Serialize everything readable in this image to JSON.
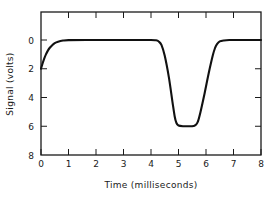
{
  "chart_data": {
    "type": "line",
    "title": "",
    "xlabel": "Time  (milliseconds)",
    "ylabel": "Signal  (volts)",
    "xlim": [
      0,
      8
    ],
    "ylim": [
      8,
      0
    ],
    "y_inverted": true,
    "grid": false,
    "legend": null,
    "xticks": [
      0,
      1,
      2,
      3,
      4,
      5,
      6,
      7,
      8
    ],
    "xtick_labels": [
      "0",
      "1",
      "2",
      "3",
      "4",
      "5",
      "6",
      "7",
      "8"
    ],
    "yticks": [
      0,
      2,
      4,
      6,
      8
    ],
    "ytick_labels": [
      "0",
      "2",
      "4",
      "6",
      "8"
    ],
    "series": [
      {
        "name": "signal",
        "color": "#111111",
        "x": [
          0.0,
          0.06,
          0.12,
          0.18,
          0.25,
          0.32,
          0.4,
          0.5,
          0.62,
          0.8,
          1.0,
          2.0,
          3.0,
          4.0,
          4.18,
          4.28,
          4.38,
          4.5,
          4.65,
          4.78,
          4.86,
          4.92,
          5.0,
          5.2,
          5.4,
          5.55,
          5.62,
          5.7,
          5.8,
          5.95,
          6.1,
          6.25,
          6.33,
          6.4,
          6.5,
          6.65,
          6.85,
          7.2,
          7.6,
          8.0
        ],
        "y": [
          2.0,
          1.62,
          1.28,
          1.0,
          0.74,
          0.54,
          0.38,
          0.22,
          0.12,
          0.04,
          0.01,
          0.0,
          0.0,
          0.0,
          0.02,
          0.1,
          0.34,
          1.1,
          2.6,
          4.3,
          5.3,
          5.75,
          5.95,
          6.0,
          6.0,
          5.98,
          5.92,
          5.7,
          5.0,
          3.7,
          2.3,
          1.05,
          0.55,
          0.28,
          0.1,
          0.03,
          0.0,
          0.0,
          0.0,
          0.0
        ]
      }
    ]
  },
  "figure": {
    "background_color": "#ffffff",
    "axis_color": "#1a1a1a",
    "curve_color": "#111111"
  }
}
